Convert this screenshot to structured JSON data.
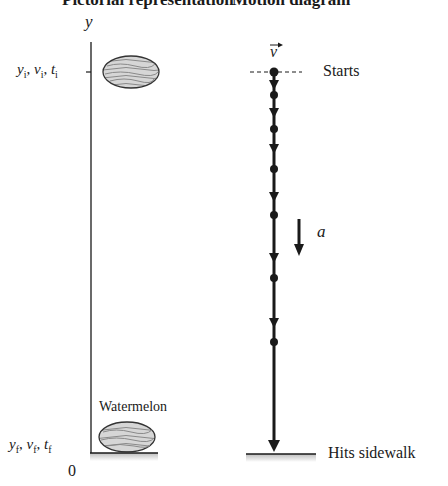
{
  "headers": {
    "left": "Pictorial representation",
    "right": "Motion diagram"
  },
  "pictorial": {
    "axis_label": "y",
    "initial_label": {
      "y": "y",
      "v": "v",
      "t": "t",
      "sub": "i"
    },
    "final_label": {
      "y": "y",
      "v": "v",
      "t": "t",
      "sub": "f"
    },
    "origin_label": "0",
    "object_label": "Watermelon"
  },
  "motion": {
    "velocity_label": "v",
    "velocity_arrow": "→",
    "acceleration_label": "a",
    "start_label": "Starts",
    "end_label": "Hits sidewalk",
    "dot_positions_y": [
      72,
      95,
      129,
      169,
      215,
      278,
      342
    ]
  },
  "colors": {
    "ink": "#1a1a1a",
    "melon_fill": "#d8d8d8",
    "ground": "#c8c8c8"
  }
}
